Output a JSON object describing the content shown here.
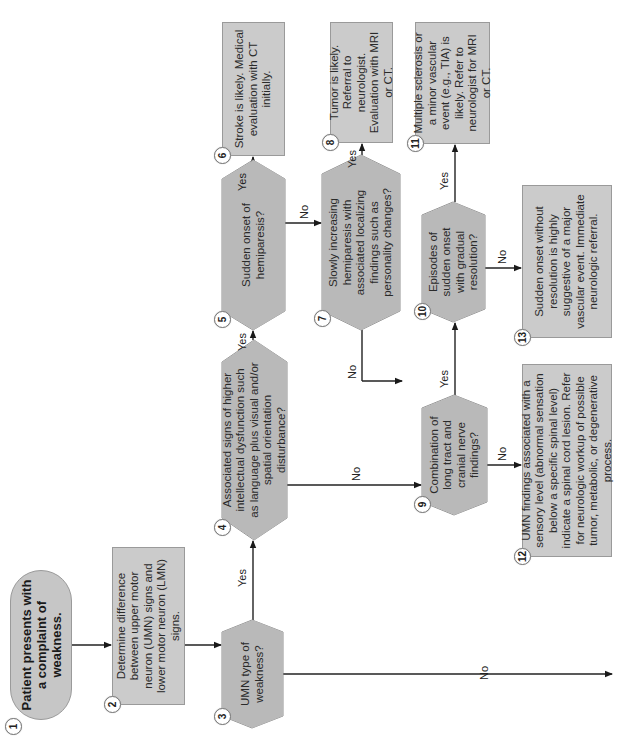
{
  "figure": {
    "orientation": "rotated 90 degrees counter-clockwise",
    "colors": {
      "shape_fill": "#c6c6c6",
      "decision_fill": "#b9b9b9",
      "border": "#9a9a9a",
      "line": "#222222",
      "badge_fill": "#ffffff"
    }
  },
  "nodes": {
    "n1": {
      "num": "1",
      "shape": "terminal",
      "text": "Patient presents with a complaint of weakness."
    },
    "n2": {
      "num": "2",
      "shape": "process",
      "text": "Determine difference between upper motor neuron (UMN) signs and lower motor neuron (LMN) signs."
    },
    "n3": {
      "num": "3",
      "shape": "decision",
      "text": "UMN type of weakness?"
    },
    "n4": {
      "num": "4",
      "shape": "decision",
      "text": "Associated signs of higher intellectual dysfunction such as language plus visual and/or spatial orientation disturbance?"
    },
    "n5": {
      "num": "5",
      "shape": "decision",
      "text": "Sudden onset of hemiparesis?"
    },
    "n6": {
      "num": "6",
      "shape": "process",
      "text": "Stroke is likely. Medical evaluation with CT initially."
    },
    "n7": {
      "num": "7",
      "shape": "decision",
      "text": "Slowly increasing hemiparesis with associated localizing findings such as personality changes?"
    },
    "n8": {
      "num": "8",
      "shape": "process",
      "text": "Tumor is likely. Referral to neurologist. Evaluation with MRI or CT."
    },
    "n9": {
      "num": "9",
      "shape": "decision",
      "text": "Combination of long tract and cranial nerve findings?"
    },
    "n10": {
      "num": "10",
      "shape": "decision",
      "text": "Episodes of sudden onset with gradual resolution?"
    },
    "n11": {
      "num": "11",
      "shape": "process",
      "text": "Multiple sclerosis or a minor vascular event (e.g., TIA) is likely. Refer to neurologist for MRI or CT."
    },
    "n12": {
      "num": "12",
      "shape": "process",
      "text": "UMN findings associated with a sensory level (abnormal sensation below a specific spinal level) indicate a spinal cord lesion. Refer for neurologic workup of possible tumor, metabolic, or degenerative process."
    },
    "n13": {
      "num": "13",
      "shape": "process",
      "text": "Sudden onset without resolution is highly suggestive of a major vascular event. Immediate neurologic referral."
    }
  },
  "edges": {
    "e1_2": {
      "from": "1",
      "to": "2",
      "label": ""
    },
    "e2_3": {
      "from": "2",
      "to": "3",
      "label": ""
    },
    "e3_4": {
      "from": "3",
      "to": "4",
      "label": "Yes"
    },
    "e3_off": {
      "from": "3",
      "to": "off-page",
      "label": "No"
    },
    "e4_5": {
      "from": "4",
      "to": "5",
      "label": "Yes"
    },
    "e4_9": {
      "from": "4",
      "to": "9",
      "label": "No"
    },
    "e5_6": {
      "from": "5",
      "to": "6",
      "label": "Yes"
    },
    "e5_7": {
      "from": "5",
      "to": "7",
      "label": "No"
    },
    "e7_8": {
      "from": "7",
      "to": "8",
      "label": "Yes"
    },
    "e7_9": {
      "from": "7",
      "to": "9",
      "label": "No"
    },
    "e9_10": {
      "from": "9",
      "to": "10",
      "label": "Yes"
    },
    "e9_12": {
      "from": "9",
      "to": "12",
      "label": "No"
    },
    "e10_11": {
      "from": "10",
      "to": "11",
      "label": "Yes"
    },
    "e10_13": {
      "from": "10",
      "to": "13",
      "label": "No"
    }
  }
}
